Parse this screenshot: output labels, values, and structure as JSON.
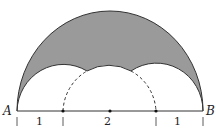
{
  "diagram": {
    "points": {
      "left": "A",
      "right": "B"
    },
    "segments": [
      {
        "label": "1"
      },
      {
        "label": "2"
      },
      {
        "label": "1"
      }
    ],
    "colors": {
      "shaded": "#9a9a9a",
      "stroke": "#333333",
      "background": "#ffffff"
    }
  }
}
